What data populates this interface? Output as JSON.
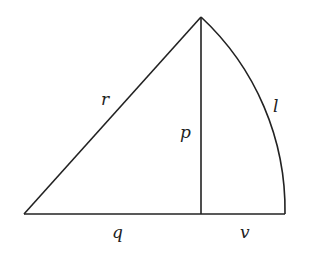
{
  "diagram": {
    "type": "geometric-figure",
    "labels": {
      "hypotenuse": "r",
      "altitude": "p",
      "arc": "l",
      "base_left": "q",
      "base_right": "v"
    },
    "colors": {
      "stroke": "#222222",
      "background": "#ffffff"
    }
  }
}
